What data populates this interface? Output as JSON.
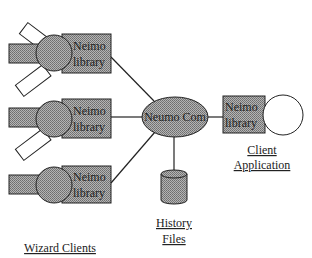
{
  "diagram": {
    "hub": {
      "label": "Neumo Com"
    },
    "wizard_clients": {
      "label": "Wizard Clients",
      "items": [
        {
          "library_line1": "Neimo",
          "library_line2": "library"
        },
        {
          "library_line1": "Neimo",
          "library_line2": "library"
        },
        {
          "library_line1": "Neimo",
          "library_line2": "library"
        }
      ]
    },
    "client_application": {
      "library_line1": "Neimo",
      "library_line2": "library",
      "label_line1": "Client",
      "label_line2": "Application"
    },
    "history_files": {
      "label_line1": "History",
      "label_line2": "Files"
    },
    "colors": {
      "fill_gray": "#9a9a9a",
      "stroke": "#222222",
      "white": "#ffffff"
    }
  }
}
